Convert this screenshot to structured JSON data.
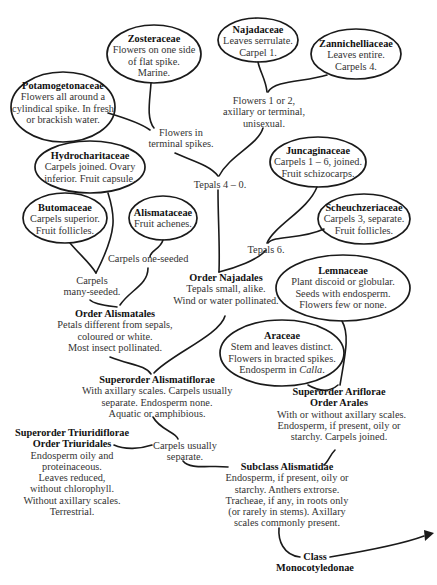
{
  "diagram": {
    "nodes": {
      "zosteraceae": {
        "title": "Zosteraceae",
        "lines": [
          "Flowers on one side",
          "of flat spike.",
          "Marine."
        ]
      },
      "najadaceae": {
        "title": "Najadaceae",
        "lines": [
          "Leaves serrulate.",
          "Carpel 1."
        ]
      },
      "zannichelliaceae": {
        "title": "Zannichelliaceae",
        "lines": [
          "Leaves entire.",
          "Carpels 4."
        ]
      },
      "potamogetonaceae": {
        "title": "Potamogetonaceae",
        "lines": [
          "Flowers all around a",
          "cylindical spike. In fresh",
          "or brackish water."
        ]
      },
      "flowers_1_or_2": {
        "lines": [
          "Flowers 1 or 2,",
          "axillary or terminal,",
          "unisexual."
        ]
      },
      "flowers_terminal": {
        "lines": [
          "Flowers in",
          "terminal spikes."
        ]
      },
      "hydrocharitaceae": {
        "title": "Hydrocharitaceae",
        "lines": [
          "Carpels joined. Ovary",
          "inferior. Fruit capsule."
        ]
      },
      "juncaginaceae": {
        "title": "Juncaginaceae",
        "lines": [
          "Carpels 1 – 6, joined.",
          "Fruit schizocarps."
        ]
      },
      "tepals_4_0": {
        "lines": [
          "Tepals 4 – 0."
        ]
      },
      "butomaceae": {
        "title": "Butomaceae",
        "lines": [
          "Carpels superior.",
          "Fruit follicles."
        ]
      },
      "alismataceae": {
        "title": "Alismataceae",
        "lines": [
          "Fruit achenes."
        ]
      },
      "scheuchzeriaceae": {
        "title": "Scheuchzeriaceae",
        "lines": [
          "Carpels 3, separate.",
          "Fruit follicles."
        ]
      },
      "carpels_one_seeded": {
        "lines": [
          "Carpels one-seeded"
        ]
      },
      "tepals_6": {
        "lines": [
          "Tepals 6."
        ]
      },
      "carpels_many_seeded": {
        "lines": [
          "Carpels",
          "many-seeded."
        ]
      },
      "order_najadales": {
        "title": "Order Najadales",
        "lines": [
          "Tepals small, alike.",
          "Wind or water pollinated."
        ]
      },
      "lemnaceae": {
        "title": "Lemnaceae",
        "lines": [
          "Plant discoid or globular.",
          "Seeds with endosperm.",
          "Flowers few or none."
        ]
      },
      "order_alismatales": {
        "title": "Order Alismatales",
        "lines": [
          "Petals different from sepals,",
          "coloured or white.",
          "Most insect pollinated."
        ]
      },
      "araceae": {
        "title": "Araceae",
        "lines": [
          "Stem and leaves distinct.",
          "Flowers in bracted spikes."
        ],
        "last_prefix": "Endosperm in ",
        "last_italic": "Calla",
        "last_suffix": "."
      },
      "superorder_alismatiflorae": {
        "title": "Superorder Alismatiflorae",
        "lines": [
          "With axillary scales. Carpels usually",
          "separate. Endosperm none.",
          "Aquatic or amphibious."
        ]
      },
      "superorder_ariflorae": {
        "title": "Superorder Ariflorae",
        "title2": "Order Arales",
        "lines": [
          "With or without axillary scales.",
          "Endosperm, if present, oily or",
          "starchy. Carpels joined."
        ]
      },
      "superorder_triuridiflorae": {
        "title": "Superorder Triuridiflorae",
        "title2": "Order Triuridales",
        "lines": [
          "Endosperm oily and",
          "proteinaceous.",
          "Leaves reduced,",
          "without chlorophyll.",
          "Without axillary scales.",
          "Terrestrial."
        ]
      },
      "carpels_usually_separate": {
        "lines": [
          "Carpels usually",
          "separate."
        ]
      },
      "subclass_alismatidae": {
        "title": "Subclass Alismatidae",
        "lines": [
          "Endosperm, if present, oily or",
          "starchy. Anthers extrorse.",
          "Tracheae, if any, in roots only",
          "(or rarely in stems). Axillary",
          "scales commonly present."
        ]
      },
      "class_monocotyledonae": {
        "title": "Class",
        "title2": "Monocotyledonae"
      }
    }
  }
}
